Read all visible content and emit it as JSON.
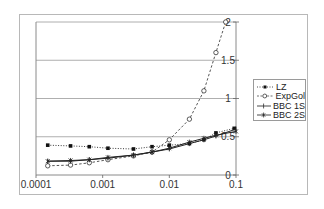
{
  "chart_data": {
    "type": "line",
    "title": "",
    "xlabel": "",
    "ylabel": "",
    "x_scale": "log",
    "xlim": [
      0.0001,
      0.1
    ],
    "ylim": [
      0,
      2
    ],
    "x_ticks": [
      "0.0001",
      "0.001",
      "0.01",
      "0.1"
    ],
    "y_ticks": [
      "0",
      "0.5",
      "1",
      "1.5",
      "2"
    ],
    "y_axis_position": "right",
    "grid": "horizontal",
    "legend_position": "right",
    "series": [
      {
        "name": "LZ",
        "marker": "filled-square",
        "line": "dotted",
        "x": [
          0.00015,
          0.00033,
          0.00063,
          0.0012,
          0.0029,
          0.0055,
          0.01,
          0.02,
          0.033,
          0.05,
          0.094
        ],
        "y": [
          0.39,
          0.38,
          0.37,
          0.35,
          0.34,
          0.37,
          0.39,
          0.41,
          0.46,
          0.55,
          0.61
        ]
      },
      {
        "name": "ExpGol",
        "marker": "open-circle",
        "line": "dashed",
        "x": [
          0.00015,
          0.00033,
          0.00063,
          0.0012,
          0.0029,
          0.0055,
          0.01,
          0.02,
          0.033,
          0.05,
          0.07
        ],
        "y": [
          0.12,
          0.13,
          0.16,
          0.2,
          0.25,
          0.3,
          0.46,
          0.73,
          1.1,
          1.6,
          2.0
        ]
      },
      {
        "name": "BBC 1S",
        "marker": "plus",
        "line": "solid",
        "x": [
          0.00015,
          0.00033,
          0.00063,
          0.0012,
          0.0029,
          0.0055,
          0.01,
          0.02,
          0.033,
          0.05,
          0.1
        ],
        "y": [
          0.18,
          0.18,
          0.2,
          0.22,
          0.26,
          0.3,
          0.34,
          0.41,
          0.46,
          0.51,
          0.6
        ]
      },
      {
        "name": "BBC 2S",
        "marker": "asterisk",
        "line": "solid",
        "x": [
          0.00015,
          0.00033,
          0.00063,
          0.0012,
          0.0029,
          0.0055,
          0.01,
          0.02,
          0.033,
          0.05,
          0.1
        ],
        "y": [
          0.18,
          0.19,
          0.2,
          0.23,
          0.26,
          0.3,
          0.35,
          0.43,
          0.48,
          0.52,
          0.57
        ]
      }
    ]
  },
  "legend": {
    "items": [
      {
        "label": "LZ"
      },
      {
        "label": "ExpGol"
      },
      {
        "label": "BBC 1S"
      },
      {
        "label": "BBC 2S"
      }
    ]
  },
  "axes": {
    "x_tick_labels": [
      "0.0001",
      "0.001",
      "0.01",
      "0.1"
    ],
    "y_tick_labels": [
      "0",
      "0.5",
      "1",
      "1.5",
      "2"
    ]
  }
}
